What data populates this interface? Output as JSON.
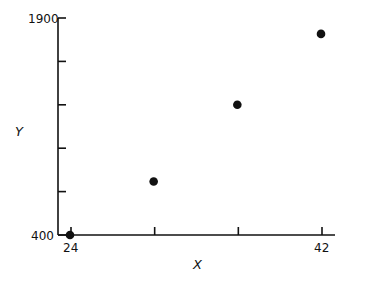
{
  "chart_data": {
    "type": "scatter",
    "title": "",
    "xlabel": "X",
    "ylabel": "Y",
    "x": [
      24,
      30,
      36,
      42
    ],
    "y": [
      400,
      770,
      1300,
      1790
    ],
    "xlim": [
      24,
      42
    ],
    "ylim": [
      400,
      1900
    ],
    "x_ticks": [
      24,
      30,
      36,
      42
    ],
    "x_tick_labels": [
      "24",
      "",
      "",
      "42"
    ],
    "y_ticks": [
      400,
      700,
      1000,
      1300,
      1600,
      1900
    ],
    "y_tick_labels": [
      "400",
      "",
      "",
      "",
      "",
      "1900"
    ],
    "grid": false,
    "legend": null,
    "marker_color": "#111111"
  },
  "labels": {
    "x_axis_title": "X",
    "y_axis_title": "Y",
    "x_min": "24",
    "x_max": "42",
    "y_min": "400",
    "y_max": "1900"
  }
}
